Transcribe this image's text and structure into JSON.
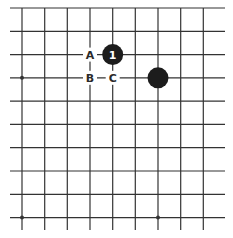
{
  "board": {
    "background": "#ffffff",
    "line_color": "#333333",
    "stone_color": "#1c1c1c",
    "vertical_lines_x": [
      22,
      44.7,
      67.3,
      90,
      112.7,
      135.3,
      158,
      180.7,
      203.3
    ],
    "horizontal_lines_y": [
      8,
      31.3,
      54.6,
      77.8,
      101.1,
      124.4,
      147.7,
      171,
      194.3,
      217.6
    ],
    "h_line_extent": [
      10,
      225
    ],
    "v_line_extent": [
      8,
      230
    ],
    "star_points": [
      {
        "x": 22,
        "y": 77.8
      },
      {
        "x": 22,
        "y": 217.6
      },
      {
        "x": 158,
        "y": 217.6
      }
    ]
  },
  "stones": [
    {
      "color": "black",
      "x": 112.7,
      "y": 54.6,
      "label": "1"
    },
    {
      "color": "black",
      "x": 158,
      "y": 77.8,
      "label": ""
    }
  ],
  "labels": [
    {
      "text": "A",
      "x": 90,
      "y": 54.6
    },
    {
      "text": "B",
      "x": 90,
      "y": 77.8
    },
    {
      "text": "C",
      "x": 112.7,
      "y": 77.8
    }
  ]
}
